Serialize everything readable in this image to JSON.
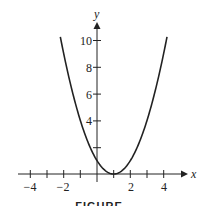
{
  "chart_data": {
    "type": "line",
    "title": "",
    "function": "y = (x - 1)^2",
    "xlabel": "x",
    "ylabel": "y",
    "xlim": [
      -4.5,
      5
    ],
    "ylim": [
      0,
      11
    ],
    "x_ticks": [
      -4,
      -3,
      -2,
      -1,
      0,
      1,
      2,
      3,
      4
    ],
    "x_tick_labels": [
      "-4",
      "-2",
      "2",
      "4"
    ],
    "y_ticks": [
      2,
      4,
      6,
      8,
      10
    ],
    "y_tick_labels": [
      "4",
      "6",
      "8",
      "10"
    ],
    "grid": false,
    "series": [
      {
        "name": "parabola",
        "x": [
          -2.2,
          -2,
          -1,
          0,
          1,
          2,
          3,
          4,
          4.2
        ],
        "values": [
          10.24,
          9,
          4,
          1,
          0,
          1,
          4,
          9,
          10.24
        ]
      }
    ],
    "caption": "FIGURE"
  },
  "labels": {
    "x_axis": "x",
    "y_axis": "y",
    "xt_m4": "−4",
    "xt_m2": "−2",
    "xt_2": "2",
    "xt_4": "4",
    "yt_4": "4",
    "yt_6": "6",
    "yt_8": "8",
    "yt_10": "10",
    "caption": "FIGURE"
  }
}
